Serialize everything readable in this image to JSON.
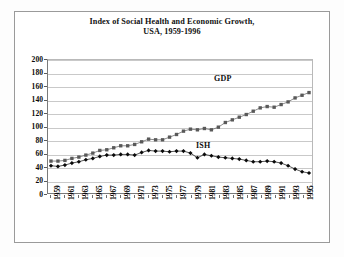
{
  "chart_data": {
    "type": "line",
    "title": "Index of Social Health and Economic Growth,",
    "subtitle": "USA, 1959-1996",
    "xlabel": "",
    "ylabel": "",
    "ylim": [
      0,
      200
    ],
    "ytick_step": 20,
    "yticks": [
      200,
      180,
      160,
      140,
      120,
      100,
      80,
      60,
      40,
      20,
      0
    ],
    "grid": true,
    "legend_position": "inline-annotation",
    "x": [
      1959,
      1960,
      1961,
      1962,
      1963,
      1964,
      1965,
      1966,
      1967,
      1968,
      1969,
      1970,
      1971,
      1972,
      1973,
      1974,
      1975,
      1976,
      1977,
      1978,
      1979,
      1980,
      1981,
      1982,
      1983,
      1984,
      1985,
      1986,
      1987,
      1988,
      1989,
      1990,
      1991,
      1992,
      1993,
      1994,
      1995,
      1996
    ],
    "xtick_labels": [
      "1959",
      "1961",
      "1963",
      "1965",
      "1967",
      "1969",
      "1971",
      "1973",
      "1975",
      "1977",
      "1979",
      "1981",
      "1983",
      "1985",
      "1987",
      "1989",
      "1991",
      "1993",
      "1995"
    ],
    "annotations": [
      {
        "text": "GDP",
        "x": 1987,
        "y": 150
      },
      {
        "text": "ISH",
        "x": 1983,
        "y": 72
      }
    ],
    "series": [
      {
        "name": "GDP",
        "marker": "square",
        "color": "#595959",
        "values": [
          48,
          48,
          49,
          52,
          54,
          57,
          60,
          64,
          65,
          68,
          71,
          71,
          73,
          77,
          81,
          80,
          80,
          84,
          88,
          93,
          96,
          95,
          97,
          95,
          99,
          106,
          110,
          114,
          118,
          123,
          128,
          130,
          129,
          133,
          137,
          143,
          147,
          151
        ]
      },
      {
        "name": "ISH",
        "marker": "diamond",
        "color": "#0a0a0a",
        "values": [
          41,
          40,
          42,
          45,
          47,
          50,
          52,
          55,
          57,
          57,
          58,
          58,
          57,
          61,
          64,
          63,
          63,
          62,
          63,
          63,
          60,
          53,
          58,
          56,
          54,
          53,
          52,
          51,
          49,
          47,
          47,
          48,
          47,
          45,
          41,
          36,
          32,
          30
        ]
      }
    ]
  },
  "chart": {
    "gdp_label": "GDP",
    "ish_label": "ISH"
  }
}
